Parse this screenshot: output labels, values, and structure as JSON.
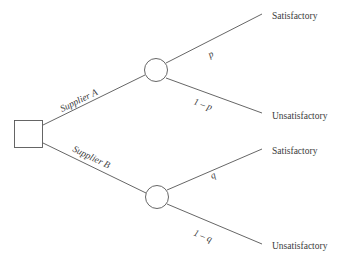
{
  "diagram": {
    "type": "decision-tree",
    "colors": {
      "background": "#ffffff",
      "line": "#555555",
      "text": "#3b3b3b"
    },
    "decision_node": {
      "shape": "square",
      "label": ""
    },
    "chance_nodes": [
      {
        "id": "chance-node-a",
        "shape": "circle",
        "label": ""
      },
      {
        "id": "chance-node-b",
        "shape": "circle",
        "label": ""
      }
    ],
    "decision_branches": [
      {
        "id": "branch-supplier-a",
        "label": "Supplier  A"
      },
      {
        "id": "branch-supplier-b",
        "label": "Supplier B"
      }
    ],
    "probability_branches": [
      {
        "id": "prob-p",
        "label": "p"
      },
      {
        "id": "prob-one-minus-p",
        "label": "1 – p"
      },
      {
        "id": "prob-q",
        "label": "q"
      },
      {
        "id": "prob-one-minus-q",
        "label": "1 – q"
      }
    ],
    "outcomes": [
      {
        "id": "outcome-a-satisfactory",
        "label": "Satisfactory"
      },
      {
        "id": "outcome-a-unsatisfactory",
        "label": "Unsatisfactory"
      },
      {
        "id": "outcome-b-satisfactory",
        "label": "Satisfactory"
      },
      {
        "id": "outcome-b-unsatisfactory",
        "label": "Unsatisfactory"
      }
    ]
  }
}
